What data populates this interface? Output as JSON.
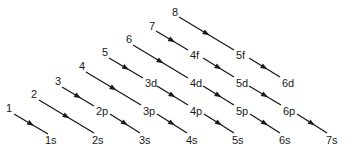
{
  "colors": {
    "line": "#1a1a1a",
    "text": "#1a1a1a",
    "background": "#ffffff"
  },
  "start_numbers": [
    {
      "label": "1",
      "x": 6,
      "y": 103
    },
    {
      "label": "2",
      "x": 31,
      "y": 89
    },
    {
      "label": "3",
      "x": 55,
      "y": 76
    },
    {
      "label": "4",
      "x": 79,
      "y": 61
    },
    {
      "label": "5",
      "x": 102,
      "y": 47
    },
    {
      "label": "6",
      "x": 126,
      "y": 34
    },
    {
      "label": "7",
      "x": 149,
      "y": 21
    },
    {
      "label": "8",
      "x": 172,
      "y": 7
    }
  ],
  "orbitals": [
    {
      "label": "1s",
      "x": 45,
      "y": 135
    },
    {
      "label": "2s",
      "x": 92,
      "y": 135
    },
    {
      "label": "3s",
      "x": 139,
      "y": 135
    },
    {
      "label": "4s",
      "x": 186,
      "y": 135
    },
    {
      "label": "5s",
      "x": 232,
      "y": 135
    },
    {
      "label": "6s",
      "x": 279,
      "y": 135
    },
    {
      "label": "7s",
      "x": 326,
      "y": 135
    },
    {
      "label": "2p",
      "x": 96,
      "y": 106
    },
    {
      "label": "3p",
      "x": 143,
      "y": 106
    },
    {
      "label": "4p",
      "x": 190,
      "y": 106
    },
    {
      "label": "5p",
      "x": 236,
      "y": 106
    },
    {
      "label": "6p",
      "x": 283,
      "y": 106
    },
    {
      "label": "3d",
      "x": 145,
      "y": 78
    },
    {
      "label": "4d",
      "x": 190,
      "y": 78
    },
    {
      "label": "5d",
      "x": 236,
      "y": 78
    },
    {
      "label": "6d",
      "x": 282,
      "y": 78
    },
    {
      "label": "4f",
      "x": 190,
      "y": 50
    },
    {
      "label": "5f",
      "x": 236,
      "y": 50
    }
  ],
  "arrows": [
    {
      "from": "1",
      "to": "1s",
      "x1": 14,
      "y1": 114,
      "x2": 48,
      "y2": 134
    },
    {
      "from": "2",
      "to": "2s",
      "x1": 39,
      "y1": 100,
      "x2": 94,
      "y2": 133
    },
    {
      "from": "3",
      "to": "2p",
      "x1": 62,
      "y1": 87,
      "x2": 94,
      "y2": 106
    },
    {
      "from": "2p",
      "to": "3s",
      "x1": 110,
      "y1": 114,
      "x2": 140,
      "y2": 133
    },
    {
      "from": "4",
      "to": "3p",
      "x1": 86,
      "y1": 72,
      "x2": 141,
      "y2": 105
    },
    {
      "from": "3p",
      "to": "4s",
      "x1": 157,
      "y1": 114,
      "x2": 187,
      "y2": 133
    },
    {
      "from": "5",
      "to": "3d",
      "x1": 109,
      "y1": 58,
      "x2": 143,
      "y2": 78
    },
    {
      "from": "3d",
      "to": "4p",
      "x1": 157,
      "y1": 86,
      "x2": 188,
      "y2": 105
    },
    {
      "from": "4p",
      "to": "5s",
      "x1": 204,
      "y1": 114,
      "x2": 234,
      "y2": 133
    },
    {
      "from": "6",
      "to": "4d",
      "x1": 133,
      "y1": 45,
      "x2": 188,
      "y2": 78
    },
    {
      "from": "4d",
      "to": "5p",
      "x1": 203,
      "y1": 86,
      "x2": 234,
      "y2": 105
    },
    {
      "from": "5p",
      "to": "6s",
      "x1": 250,
      "y1": 114,
      "x2": 280,
      "y2": 133
    },
    {
      "from": "7",
      "to": "4f",
      "x1": 156,
      "y1": 31,
      "x2": 188,
      "y2": 50
    },
    {
      "from": "4f",
      "to": "5d",
      "x1": 203,
      "y1": 58,
      "x2": 234,
      "y2": 77
    },
    {
      "from": "5d",
      "to": "6p",
      "x1": 249,
      "y1": 86,
      "x2": 281,
      "y2": 105
    },
    {
      "from": "6p",
      "to": "7s",
      "x1": 297,
      "y1": 114,
      "x2": 327,
      "y2": 133
    },
    {
      "from": "8",
      "to": "5f",
      "x1": 179,
      "y1": 17,
      "x2": 234,
      "y2": 50
    },
    {
      "from": "5f",
      "to": "6d",
      "x1": 249,
      "y1": 58,
      "x2": 280,
      "y2": 77
    }
  ]
}
